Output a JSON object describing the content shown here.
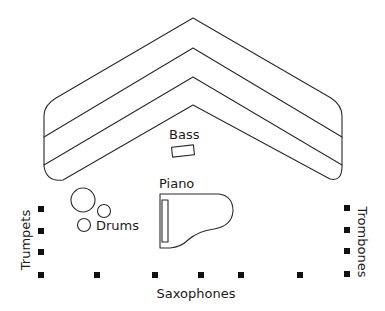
{
  "diagram": {
    "stage": {
      "name": "riser-chevron",
      "tiers": 4
    },
    "labels": {
      "bass": "Bass",
      "piano": "Piano",
      "drums": "Drums",
      "trumpets": "Trumpets",
      "trombones": "Trombones",
      "saxophones": "Saxophones"
    },
    "sections": [
      {
        "name": "Trumpets",
        "seat_count": 4,
        "orientation": "vertical-left"
      },
      {
        "name": "Trombones",
        "seat_count": 4,
        "orientation": "vertical-right"
      },
      {
        "name": "Saxophones",
        "seat_count": 7,
        "orientation": "horizontal-bottom"
      }
    ],
    "colors": {
      "line": "#2a2a2a",
      "seat": "#111111",
      "background": "#ffffff"
    }
  }
}
